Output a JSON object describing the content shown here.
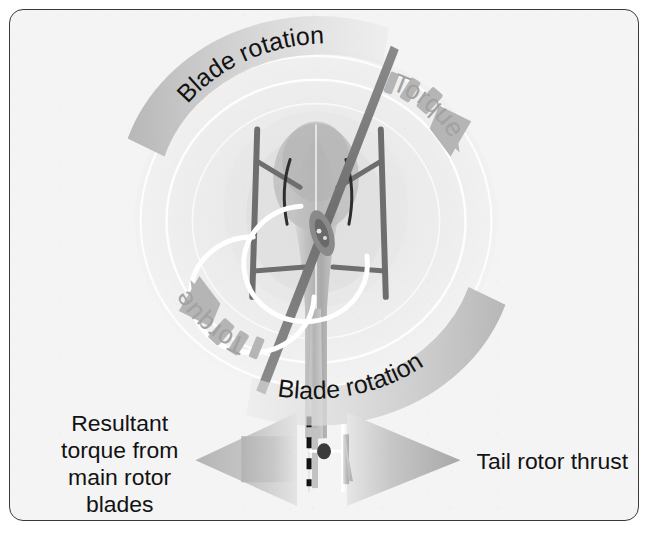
{
  "figure": {
    "kind": "technical-diagram",
    "background_color": "#f4f4f4",
    "border_color": "#3a3a3a",
    "canvas": {
      "width": 650,
      "height": 534
    }
  },
  "labels": {
    "blade_rotation_top": "Blade rotation",
    "blade_rotation_bottom": "Blade rotation",
    "torque_top_right": "Torque",
    "torque_bottom_left": "Torque",
    "resultant_torque_line1": "Resultant",
    "resultant_torque_line2": "torque from",
    "resultant_torque_line3": "main rotor",
    "resultant_torque_line4": "blades",
    "tail_rotor_thrust": "Tail rotor thrust"
  },
  "colors": {
    "label_text_dark": "#131313",
    "label_text_gray": "#9a9a9a",
    "band_gray": "#b9b9b9",
    "arrow_gray": "#b0b0b0",
    "blade_dark": "#7c7c7c",
    "body_gray": "#c9c9c9",
    "rotor_disc": "#ededed",
    "white_arrow": "#ffffff"
  },
  "elements": {
    "rotor_disc_name": "main-rotor-disc",
    "fuselage_name": "helicopter-fuselage-top-view",
    "main_blade_name": "main-rotor-blade",
    "skids_name": "landing-skids",
    "rotor_hub_name": "main-rotor-hub",
    "tail_boom_name": "tail-boom",
    "tail_rotor_name": "tail-rotor",
    "white_spin_arrow_name": "fuselage-counter-rotation-arrow",
    "centerline_name": "tail-centerline-dashed"
  }
}
